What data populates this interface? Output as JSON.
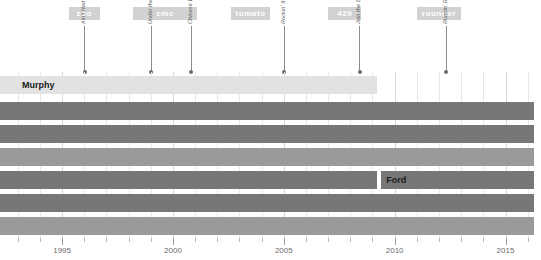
{
  "chart_data": {
    "type": "bar",
    "title": "",
    "xlabel": "",
    "ylabel": "",
    "xlim": [
      1992.2,
      2016.6
    ],
    "grid": true,
    "legend": "none",
    "orientation": "horizontal-timeline",
    "axis": {
      "major_ticks": [
        1995,
        2000,
        2005,
        2010,
        2015
      ],
      "major_tick_labels": [
        "1995",
        "2000",
        "2005",
        "2010",
        "2015"
      ],
      "minor_tick_interval": 1,
      "minor_ticks": [
        1993,
        1994,
        1996,
        1997,
        1998,
        1999,
        2001,
        2002,
        2003,
        2004,
        2006,
        2007,
        2008,
        2009,
        2011,
        2012,
        2013,
        2014,
        2016
      ]
    },
    "labels_row": [
      {
        "name": "zoo",
        "start": 1995.3,
        "end": 1996.7,
        "color": "#d2d2d2"
      },
      {
        "name": "cmc",
        "start": 1998.2,
        "end": 2001.1,
        "color": "#d2d2d2"
      },
      {
        "name": "tomato",
        "start": 2002.6,
        "end": 2004.4,
        "color": "#d2d2d2"
      },
      {
        "name": "429",
        "start": 2007.0,
        "end": 2008.5,
        "color": "#d2d2d2"
      },
      {
        "name": "rounder",
        "start": 2011.0,
        "end": 2013.0,
        "color": "#d2d2d2"
      }
    ],
    "events": [
      {
        "title": "Ain't Had Enough Fun",
        "year": 1996.0
      },
      {
        "title": "Under the Radar",
        "year": 1999.0
      },
      {
        "title": "Chinese Work Songs",
        "year": 2000.8
      },
      {
        "title": "Rockin' It at the Barn",
        "year": 2005.0
      },
      {
        "title": "Join the Band",
        "year": 2008.4
      },
      {
        "title": "Runnin' Rig",
        "year": 2012.3
      }
    ],
    "series": [
      {
        "name": "Murphy",
        "label": "Murphy",
        "label_shown": true,
        "start": 1992.2,
        "end": 2009.2,
        "color": "#e2e2e2",
        "row": 0
      },
      {
        "name": "row-2",
        "label": "",
        "label_shown": false,
        "start": 1992.2,
        "end": 2016.3,
        "color": "#777777",
        "row": 1
      },
      {
        "name": "row-3",
        "label": "",
        "label_shown": false,
        "start": 1992.2,
        "end": 2016.3,
        "color": "#777777",
        "row": 2
      },
      {
        "name": "row-4",
        "label": "",
        "label_shown": false,
        "start": 1992.2,
        "end": 2016.3,
        "color": "#9a9a9a",
        "row": 3
      },
      {
        "name": "Ford",
        "label": "Ford",
        "label_shown": true,
        "start": 1992.2,
        "end": 2016.3,
        "color": "#777777",
        "row": 4,
        "gap_at": 2009.3
      },
      {
        "name": "row-6",
        "label": "",
        "label_shown": false,
        "start": 1992.2,
        "end": 2016.3,
        "color": "#777777",
        "row": 5
      },
      {
        "name": "row-7",
        "label": "",
        "label_shown": false,
        "start": 1992.2,
        "end": 2016.3,
        "color": "#9a9a9a",
        "row": 6
      }
    ]
  }
}
